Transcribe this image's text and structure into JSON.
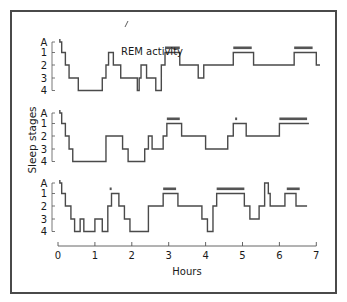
{
  "chart_data": {
    "type": "line",
    "subtype": "step (hypnogram)",
    "title": "",
    "xlabel": "Hours",
    "ylabel": "Sleep stages",
    "xlim": [
      0,
      7
    ],
    "x_ticks": [
      "0",
      "1",
      "2",
      "3",
      "4",
      "5",
      "6",
      "7"
    ],
    "y_ticks": [
      "A",
      "1",
      "2",
      "3",
      "4"
    ],
    "stage_levels": {
      "A": 0,
      "1": 1,
      "2": 2,
      "3": 3,
      "4": 4
    },
    "annotation": {
      "text": "REM activity",
      "x": 1.35,
      "points_to_panel": 1
    },
    "series": [
      {
        "name": "Night 1",
        "steps": [
          [
            0.05,
            0
          ],
          [
            0.1,
            1
          ],
          [
            0.2,
            2
          ],
          [
            0.3,
            3
          ],
          [
            0.55,
            4
          ],
          [
            1.2,
            3
          ],
          [
            1.3,
            2
          ],
          [
            1.37,
            1
          ],
          [
            1.5,
            2
          ],
          [
            1.7,
            3
          ],
          [
            2.15,
            4
          ],
          [
            2.2,
            3
          ],
          [
            2.25,
            2
          ],
          [
            2.4,
            3
          ],
          [
            2.65,
            4
          ],
          [
            2.8,
            2
          ],
          [
            2.9,
            1
          ],
          [
            3.3,
            2
          ],
          [
            3.8,
            3
          ],
          [
            3.95,
            2
          ],
          [
            4.75,
            1
          ],
          [
            5.3,
            2
          ],
          [
            6.4,
            1
          ],
          [
            7.0,
            2
          ],
          [
            7.1,
            2
          ]
        ],
        "rem_bars": [
          [
            2.9,
            3.3
          ],
          [
            4.75,
            5.25
          ],
          [
            6.4,
            6.9
          ]
        ]
      },
      {
        "name": "Night 2",
        "steps": [
          [
            0.05,
            0
          ],
          [
            0.1,
            1
          ],
          [
            0.2,
            2
          ],
          [
            0.3,
            3
          ],
          [
            0.4,
            4
          ],
          [
            1.3,
            2
          ],
          [
            1.75,
            3
          ],
          [
            1.9,
            4
          ],
          [
            2.35,
            3
          ],
          [
            2.45,
            2
          ],
          [
            2.55,
            3
          ],
          [
            2.85,
            2
          ],
          [
            2.95,
            1
          ],
          [
            3.35,
            2
          ],
          [
            4.0,
            3
          ],
          [
            4.6,
            2
          ],
          [
            4.75,
            1
          ],
          [
            5.1,
            2
          ],
          [
            6.0,
            1
          ],
          [
            6.8,
            1
          ]
        ],
        "rem_bars": [
          [
            2.95,
            3.3
          ],
          [
            4.8,
            4.85
          ],
          [
            6.0,
            6.75
          ]
        ]
      },
      {
        "name": "Night 3",
        "steps": [
          [
            0.05,
            0
          ],
          [
            0.1,
            1
          ],
          [
            0.2,
            2
          ],
          [
            0.35,
            3
          ],
          [
            0.45,
            4
          ],
          [
            0.6,
            3
          ],
          [
            0.7,
            4
          ],
          [
            1.0,
            3
          ],
          [
            1.2,
            4
          ],
          [
            1.35,
            2
          ],
          [
            1.45,
            1
          ],
          [
            1.65,
            2
          ],
          [
            1.8,
            3
          ],
          [
            1.95,
            4
          ],
          [
            2.45,
            2
          ],
          [
            2.85,
            1
          ],
          [
            3.25,
            2
          ],
          [
            3.9,
            3
          ],
          [
            4.05,
            4
          ],
          [
            4.2,
            2
          ],
          [
            4.3,
            1
          ],
          [
            5.05,
            2
          ],
          [
            5.2,
            3
          ],
          [
            5.45,
            2
          ],
          [
            5.6,
            0
          ],
          [
            5.7,
            1
          ],
          [
            5.75,
            2
          ],
          [
            6.15,
            1
          ],
          [
            6.45,
            2
          ],
          [
            6.75,
            2
          ]
        ],
        "rem_bars": [
          [
            1.4,
            1.45
          ],
          [
            2.85,
            3.2
          ],
          [
            4.3,
            5.05
          ],
          [
            6.2,
            6.55
          ]
        ]
      }
    ]
  },
  "labels": {
    "annotation": "REM activity",
    "ylabel": "Sleep stages",
    "xlabel": "Hours"
  }
}
